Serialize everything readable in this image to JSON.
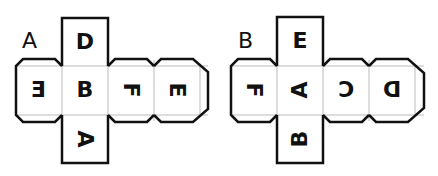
{
  "diagram": {
    "type": "cube-nets",
    "nets": [
      {
        "label": "A",
        "faces": [
          {
            "position": "top",
            "letter": "D",
            "orientation": "upright"
          },
          {
            "position": "left",
            "letter": "E",
            "orientation": "mirrored"
          },
          {
            "position": "center",
            "letter": "B",
            "orientation": "upright"
          },
          {
            "position": "right-1",
            "letter": "F",
            "orientation": "rotated-90-cw"
          },
          {
            "position": "right-2",
            "letter": "E",
            "orientation": "rotated-90-cw"
          },
          {
            "position": "bottom",
            "letter": "A",
            "orientation": "rotated-90-cw"
          }
        ]
      },
      {
        "label": "B",
        "faces": [
          {
            "position": "top",
            "letter": "E",
            "orientation": "upright"
          },
          {
            "position": "left",
            "letter": "F",
            "orientation": "rotated-90-cw"
          },
          {
            "position": "center",
            "letter": "A",
            "orientation": "rotated-90-ccw"
          },
          {
            "position": "right-1",
            "letter": "C",
            "orientation": "mirrored"
          },
          {
            "position": "right-2",
            "letter": "D",
            "orientation": "mirrored"
          },
          {
            "position": "bottom",
            "letter": "B",
            "orientation": "rotated-90-ccw"
          }
        ]
      }
    ],
    "colors": {
      "stroke": "#111111",
      "fold_line": "#bbbbbb",
      "background": "#ffffff"
    }
  }
}
